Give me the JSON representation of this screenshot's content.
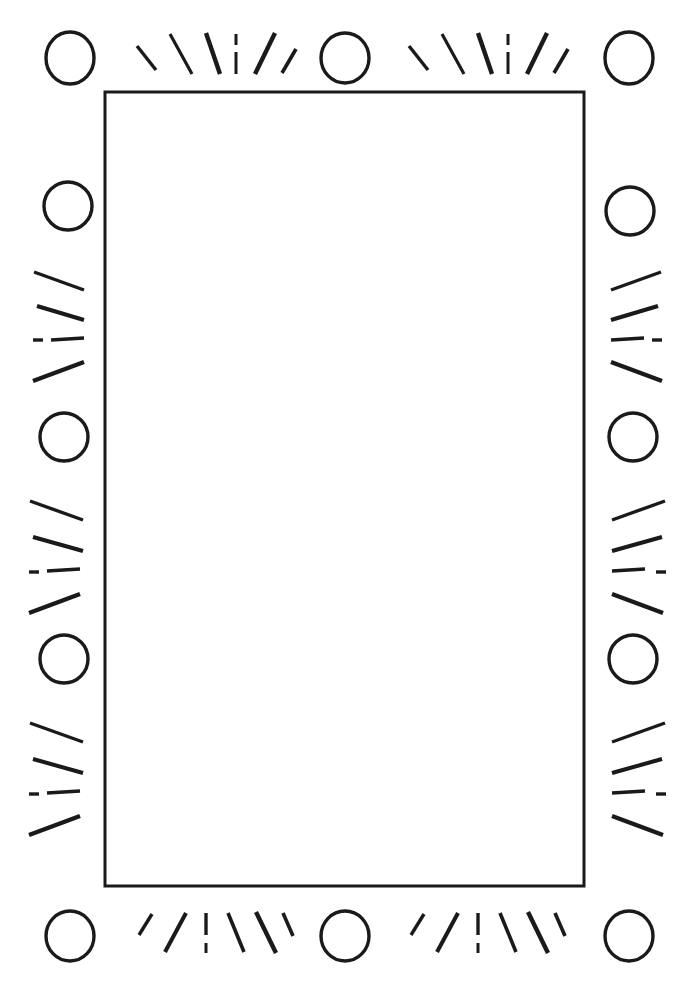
{
  "document": {
    "title": "Decorative Sunburst Border Frame",
    "kind": "line-art-illustration",
    "width": 687,
    "height": 1001,
    "background_color": "#ffffff",
    "ink_color": "#1a1a1a"
  },
  "frame": {
    "label": "blank-inner-panel",
    "x": 105,
    "y": 92,
    "width": 479,
    "height": 794,
    "stroke_width": 3,
    "stroke_color": "#1a1a1a",
    "fill_color": "#ffffff",
    "content_text": ""
  },
  "ornament": {
    "description": "Hand-drawn border of open circles separated by radiating fan-shaped tick marks, repeating around all four sides.",
    "circle": {
      "radius": 22,
      "stroke_width": 3.4,
      "stroke_color": "#1a1a1a",
      "count": 12
    },
    "tick": {
      "stroke_color": "#1a1a1a",
      "stroke_width_min": 2.2,
      "stroke_width_max": 5.0,
      "marks_per_fan": 6,
      "fan_count": 8
    },
    "circles": [
      {
        "name": "circle-top-left",
        "cx": 70,
        "cy": 58,
        "rx": 24,
        "ry": 26
      },
      {
        "name": "circle-top-center",
        "cx": 345,
        "cy": 58,
        "rx": 24,
        "ry": 25
      },
      {
        "name": "circle-top-right",
        "cx": 629,
        "cy": 58,
        "rx": 24,
        "ry": 26
      },
      {
        "name": "circle-left-upper",
        "cx": 68,
        "cy": 206,
        "rx": 24,
        "ry": 24
      },
      {
        "name": "circle-left-mid",
        "cx": 64,
        "cy": 437,
        "rx": 24,
        "ry": 24
      },
      {
        "name": "circle-left-lower",
        "cx": 64,
        "cy": 659,
        "rx": 24,
        "ry": 24
      },
      {
        "name": "circle-right-upper",
        "cx": 630,
        "cy": 211,
        "rx": 24,
        "ry": 24
      },
      {
        "name": "circle-right-mid",
        "cx": 633,
        "cy": 437,
        "rx": 24,
        "ry": 24
      },
      {
        "name": "circle-right-lower",
        "cx": 633,
        "cy": 659,
        "rx": 24,
        "ry": 24
      },
      {
        "name": "circle-bottom-left",
        "cx": 70,
        "cy": 936,
        "rx": 24,
        "ry": 25
      },
      {
        "name": "circle-bottom-center",
        "cx": 345,
        "cy": 936,
        "rx": 24,
        "ry": 25
      },
      {
        "name": "circle-bottom-right",
        "cx": 629,
        "cy": 936,
        "rx": 24,
        "ry": 25
      }
    ],
    "fans": [
      {
        "name": "fan-top-left-segment",
        "side": "top",
        "ticks": [
          {
            "x1": 137,
            "y1": 46,
            "x2": 156,
            "y2": 70,
            "w": 3.4
          },
          {
            "x1": 170,
            "y1": 34,
            "x2": 192,
            "y2": 74,
            "w": 3.2
          },
          {
            "x1": 206,
            "y1": 33,
            "x2": 220,
            "y2": 74,
            "w": 4.4
          },
          {
            "x1": 236,
            "y1": 34,
            "x2": 236,
            "y2": 45,
            "w": 3.0
          },
          {
            "x1": 236,
            "y1": 52,
            "x2": 236,
            "y2": 74,
            "w": 3.0
          },
          {
            "x1": 275,
            "y1": 33,
            "x2": 255,
            "y2": 74,
            "w": 4.4
          },
          {
            "x1": 296,
            "y1": 49,
            "x2": 282,
            "y2": 73,
            "w": 3.6
          }
        ]
      },
      {
        "name": "fan-top-right-segment",
        "side": "top",
        "ticks": [
          {
            "x1": 409,
            "y1": 46,
            "x2": 428,
            "y2": 70,
            "w": 3.4
          },
          {
            "x1": 442,
            "y1": 34,
            "x2": 464,
            "y2": 74,
            "w": 3.2
          },
          {
            "x1": 478,
            "y1": 33,
            "x2": 492,
            "y2": 74,
            "w": 4.4
          },
          {
            "x1": 508,
            "y1": 34,
            "x2": 508,
            "y2": 45,
            "w": 3.0
          },
          {
            "x1": 508,
            "y1": 52,
            "x2": 508,
            "y2": 74,
            "w": 3.0
          },
          {
            "x1": 547,
            "y1": 33,
            "x2": 527,
            "y2": 74,
            "w": 4.4
          },
          {
            "x1": 568,
            "y1": 49,
            "x2": 554,
            "y2": 73,
            "w": 3.6
          }
        ]
      },
      {
        "name": "fan-left-upper-segment",
        "side": "left",
        "ticks": [
          {
            "x1": 34,
            "y1": 272,
            "x2": 84,
            "y2": 290,
            "w": 3.4
          },
          {
            "x1": 37,
            "y1": 306,
            "x2": 84,
            "y2": 320,
            "w": 4.0
          },
          {
            "x1": 33,
            "y1": 340,
            "x2": 43,
            "y2": 340,
            "w": 3.4
          },
          {
            "x1": 51,
            "y1": 340,
            "x2": 84,
            "y2": 338,
            "w": 3.4
          },
          {
            "x1": 33,
            "y1": 381,
            "x2": 84,
            "y2": 362,
            "w": 4.4
          }
        ]
      },
      {
        "name": "fan-left-mid-segment",
        "side": "left",
        "ticks": [
          {
            "x1": 30,
            "y1": 501,
            "x2": 83,
            "y2": 520,
            "w": 3.4
          },
          {
            "x1": 33,
            "y1": 537,
            "x2": 83,
            "y2": 551,
            "w": 4.0
          },
          {
            "x1": 29,
            "y1": 572,
            "x2": 39,
            "y2": 572,
            "w": 3.4
          },
          {
            "x1": 47,
            "y1": 571,
            "x2": 80,
            "y2": 569,
            "w": 3.4
          },
          {
            "x1": 29,
            "y1": 613,
            "x2": 80,
            "y2": 594,
            "w": 4.4
          }
        ]
      },
      {
        "name": "fan-left-lower-segment",
        "side": "left",
        "ticks": [
          {
            "x1": 30,
            "y1": 723,
            "x2": 83,
            "y2": 742,
            "w": 3.4
          },
          {
            "x1": 33,
            "y1": 759,
            "x2": 83,
            "y2": 773,
            "w": 4.0
          },
          {
            "x1": 29,
            "y1": 794,
            "x2": 39,
            "y2": 794,
            "w": 3.4
          },
          {
            "x1": 47,
            "y1": 793,
            "x2": 80,
            "y2": 791,
            "w": 3.4
          },
          {
            "x1": 29,
            "y1": 835,
            "x2": 80,
            "y2": 816,
            "w": 4.4
          }
        ]
      },
      {
        "name": "fan-right-upper-segment",
        "side": "right",
        "ticks": [
          {
            "x1": 611,
            "y1": 290,
            "x2": 661,
            "y2": 272,
            "w": 3.4
          },
          {
            "x1": 611,
            "y1": 320,
            "x2": 658,
            "y2": 306,
            "w": 4.0
          },
          {
            "x1": 611,
            "y1": 340,
            "x2": 644,
            "y2": 338,
            "w": 3.4
          },
          {
            "x1": 652,
            "y1": 340,
            "x2": 662,
            "y2": 340,
            "w": 3.4
          },
          {
            "x1": 611,
            "y1": 362,
            "x2": 662,
            "y2": 381,
            "w": 4.4
          }
        ]
      },
      {
        "name": "fan-right-mid-segment",
        "side": "right",
        "ticks": [
          {
            "x1": 612,
            "y1": 520,
            "x2": 665,
            "y2": 501,
            "w": 3.4
          },
          {
            "x1": 612,
            "y1": 551,
            "x2": 662,
            "y2": 537,
            "w": 4.0
          },
          {
            "x1": 612,
            "y1": 571,
            "x2": 645,
            "y2": 569,
            "w": 3.4
          },
          {
            "x1": 656,
            "y1": 572,
            "x2": 666,
            "y2": 572,
            "w": 3.4
          },
          {
            "x1": 612,
            "y1": 594,
            "x2": 663,
            "y2": 613,
            "w": 4.4
          }
        ]
      },
      {
        "name": "fan-right-lower-segment",
        "side": "right",
        "ticks": [
          {
            "x1": 612,
            "y1": 742,
            "x2": 665,
            "y2": 723,
            "w": 3.4
          },
          {
            "x1": 612,
            "y1": 773,
            "x2": 662,
            "y2": 759,
            "w": 4.0
          },
          {
            "x1": 612,
            "y1": 793,
            "x2": 645,
            "y2": 791,
            "w": 3.4
          },
          {
            "x1": 656,
            "y1": 794,
            "x2": 666,
            "y2": 794,
            "w": 3.4
          },
          {
            "x1": 612,
            "y1": 816,
            "x2": 663,
            "y2": 835,
            "w": 4.4
          }
        ]
      },
      {
        "name": "fan-bottom-left-segment",
        "side": "bottom",
        "ticks": [
          {
            "x1": 152,
            "y1": 914,
            "x2": 139,
            "y2": 935,
            "w": 3.4
          },
          {
            "x1": 186,
            "y1": 913,
            "x2": 165,
            "y2": 952,
            "w": 4.0
          },
          {
            "x1": 206,
            "y1": 913,
            "x2": 206,
            "y2": 935,
            "w": 3.4
          },
          {
            "x1": 206,
            "y1": 943,
            "x2": 206,
            "y2": 953,
            "w": 3.0
          },
          {
            "x1": 228,
            "y1": 913,
            "x2": 244,
            "y2": 952,
            "w": 3.6
          },
          {
            "x1": 256,
            "y1": 912,
            "x2": 276,
            "y2": 953,
            "w": 4.4
          },
          {
            "x1": 283,
            "y1": 913,
            "x2": 293,
            "y2": 936,
            "w": 3.6
          }
        ]
      },
      {
        "name": "fan-bottom-right-segment",
        "side": "bottom",
        "ticks": [
          {
            "x1": 424,
            "y1": 914,
            "x2": 411,
            "y2": 935,
            "w": 3.4
          },
          {
            "x1": 458,
            "y1": 913,
            "x2": 437,
            "y2": 952,
            "w": 4.0
          },
          {
            "x1": 478,
            "y1": 913,
            "x2": 478,
            "y2": 935,
            "w": 3.4
          },
          {
            "x1": 478,
            "y1": 943,
            "x2": 478,
            "y2": 953,
            "w": 3.0
          },
          {
            "x1": 500,
            "y1": 913,
            "x2": 516,
            "y2": 952,
            "w": 3.6
          },
          {
            "x1": 528,
            "y1": 912,
            "x2": 548,
            "y2": 953,
            "w": 4.4
          },
          {
            "x1": 555,
            "y1": 913,
            "x2": 565,
            "y2": 936,
            "w": 3.6
          }
        ]
      }
    ]
  }
}
